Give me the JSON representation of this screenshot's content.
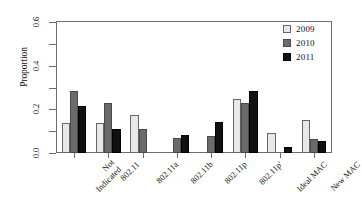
{
  "chart_data": {
    "type": "bar",
    "title": "",
    "subtitle": "",
    "xlabel": "",
    "ylabel": "Proportion",
    "ylim": [
      0.0,
      0.6
    ],
    "yticks": [
      0.0,
      0.1,
      0.2,
      0.3,
      0.4,
      0.5,
      0.6
    ],
    "ytick_labels": [
      "0.0",
      "",
      "0.2",
      "",
      "0.4",
      "",
      "0.6"
    ],
    "grid": false,
    "legend_position": "top-right",
    "categories": [
      "Not Indicated",
      "802.11",
      "802.11a",
      "802.11b",
      "802.11p",
      "802.11p'",
      "Ideal MAC",
      "New MAC"
    ],
    "series": [
      {
        "name": "2009",
        "color": "#e8e8e8",
        "values": [
          0.137,
          0.137,
          0.172,
          0.0,
          0.0,
          0.247,
          0.092,
          0.152
        ]
      },
      {
        "name": "2010",
        "color": "#6b6b6b",
        "values": [
          0.286,
          0.231,
          0.11,
          0.071,
          0.077,
          0.231,
          0.0,
          0.066
        ]
      },
      {
        "name": "2011",
        "color": "#111111",
        "values": [
          0.214,
          0.11,
          0.0,
          0.082,
          0.143,
          0.286,
          0.028,
          0.055
        ]
      }
    ]
  },
  "legend": {
    "entries": [
      {
        "label": "2009",
        "series_index": 0
      },
      {
        "label": "2010",
        "series_index": 1
      },
      {
        "label": "2011",
        "series_index": 2
      }
    ]
  },
  "axes": {
    "y_title": "Proportion"
  }
}
